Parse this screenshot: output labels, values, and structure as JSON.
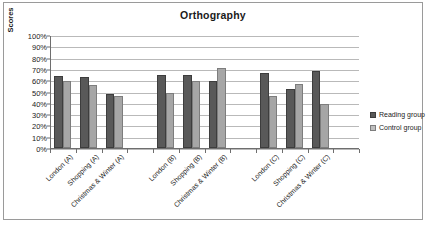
{
  "chart_data": {
    "type": "bar",
    "title": "Orthography",
    "xlabel": "",
    "ylabel": "Scores",
    "ylim": [
      0,
      100
    ],
    "y_unit": "%",
    "grid": true,
    "legend_position": "right",
    "categories": [
      "London (A)",
      "Shopping (A)",
      "Christmas & Winter (A)",
      "",
      "London (B)",
      "Shopping (B)",
      "Christmas & Winter (B)",
      "",
      "London (C)",
      "Shopping (C)",
      "Christmas & Winter (C)",
      ""
    ],
    "series": [
      {
        "name": "Reading group",
        "color": "#595959",
        "values": [
          64,
          63,
          48,
          null,
          65,
          65,
          59,
          null,
          66,
          52,
          68,
          null
        ]
      },
      {
        "name": "Control group",
        "color": "#a6a6a6",
        "values": [
          59,
          56,
          46,
          null,
          49,
          59,
          71,
          null,
          46,
          57,
          39,
          null
        ]
      }
    ],
    "ytick_labels": [
      "100%",
      "90%",
      "80%",
      "70%",
      "60%",
      "50%",
      "40%",
      "30%",
      "20%",
      "10%",
      "0%"
    ],
    "ytick_values": [
      100,
      90,
      80,
      70,
      60,
      50,
      40,
      30,
      20,
      10,
      0
    ]
  },
  "legend": {
    "items": [
      {
        "label": "Reading group",
        "swatch": "dark-square-swatch"
      },
      {
        "label": "Control group",
        "swatch": "light-square-swatch"
      }
    ]
  }
}
